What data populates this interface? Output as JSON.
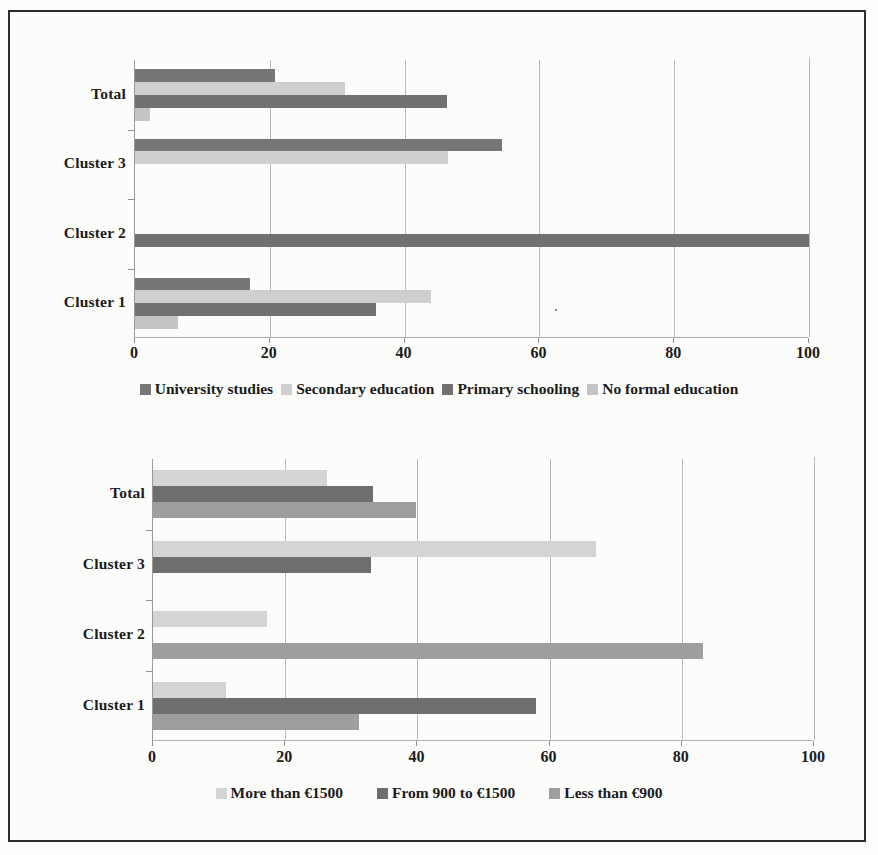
{
  "figure": {
    "background": "#fcfcfa",
    "border_color": "#2e2e2e"
  },
  "chart_data": [
    {
      "id": "education",
      "type": "bar",
      "orientation": "horizontal",
      "title": "",
      "xlabel": "",
      "ylabel": "",
      "xlim": [
        0,
        100
      ],
      "xticks": [
        0,
        20,
        40,
        60,
        80,
        100
      ],
      "xtick_labels": [
        "0",
        "20",
        "40",
        "60",
        "80",
        "100"
      ],
      "grid": true,
      "legend_position": "bottom",
      "categories": [
        "Cluster 1",
        "Cluster 2",
        "Cluster 3",
        "Total"
      ],
      "categories_top_to_bottom": [
        "Total",
        "Cluster 3",
        "Cluster 2",
        "Cluster 1"
      ],
      "series": [
        {
          "name": "University studies",
          "color": "#767676",
          "values_top_to_bottom": [
            20.8,
            54.4,
            0,
            17.0
          ]
        },
        {
          "name": "Secondary education",
          "color": "#cfcfcf",
          "values_top_to_bottom": [
            31.2,
            46.5,
            0,
            43.9
          ]
        },
        {
          "name": "Primary schooling",
          "color": "#717171",
          "values_top_to_bottom": [
            46.3,
            0,
            100.0,
            35.8
          ]
        },
        {
          "name": "No formal education",
          "color": "#c4c4c4",
          "values_top_to_bottom": [
            2.2,
            0,
            0,
            6.4
          ]
        }
      ]
    },
    {
      "id": "income",
      "type": "bar",
      "orientation": "horizontal",
      "title": "",
      "xlabel": "",
      "ylabel": "",
      "xlim": [
        0,
        100
      ],
      "xticks": [
        0,
        20,
        40,
        60,
        80,
        100
      ],
      "xtick_labels": [
        "0",
        "20",
        "40",
        "60",
        "80",
        "100"
      ],
      "grid": true,
      "legend_position": "bottom",
      "categories": [
        "Cluster 1",
        "Cluster 2",
        "Cluster 3",
        "Total"
      ],
      "categories_top_to_bottom": [
        "Total",
        "Cluster 3",
        "Cluster 2",
        "Cluster 1"
      ],
      "series": [
        {
          "name": "More than €1500",
          "color": "#d4d4d4",
          "values_top_to_bottom": [
            26.3,
            67.0,
            17.2,
            11.0
          ]
        },
        {
          "name": "From 900 to €1500",
          "color": "#6e6e6e",
          "values_top_to_bottom": [
            33.3,
            33.0,
            0,
            58.0
          ]
        },
        {
          "name": "Less than €900",
          "color": "#9e9e9e",
          "values_top_to_bottom": [
            39.8,
            0,
            83.2,
            31.2
          ]
        }
      ]
    }
  ],
  "chart1": {
    "categories": [
      {
        "label": "Total"
      },
      {
        "label": "Cluster 3"
      },
      {
        "label": "Cluster 2"
      },
      {
        "label": "Cluster 1"
      }
    ],
    "xtick_labels": [
      "0",
      "20",
      "40",
      "60",
      "80",
      "100"
    ],
    "legend": [
      {
        "label": "University studies",
        "color": "#767676"
      },
      {
        "label": "Secondary education",
        "color": "#cfcfcf"
      },
      {
        "label": "Primary schooling",
        "color": "#717171"
      },
      {
        "label": "No formal education",
        "color": "#c4c4c4"
      }
    ]
  },
  "chart2": {
    "categories": [
      {
        "label": "Total"
      },
      {
        "label": "Cluster 3"
      },
      {
        "label": "Cluster 2"
      },
      {
        "label": "Cluster 1"
      }
    ],
    "xtick_labels": [
      "0",
      "20",
      "40",
      "60",
      "80",
      "100"
    ],
    "legend": [
      {
        "label": "More than €1500",
        "color": "#d4d4d4"
      },
      {
        "label": "From 900 to €1500",
        "color": "#6e6e6e"
      },
      {
        "label": "Less than €900",
        "color": "#9e9e9e"
      }
    ]
  }
}
